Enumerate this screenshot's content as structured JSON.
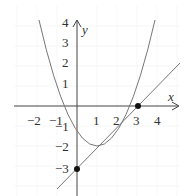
{
  "diagram": {
    "x_axis_label": "x",
    "y_axis_label": "y",
    "x_ticks": [
      "−2",
      "−1",
      "1",
      "2",
      "3",
      "4"
    ],
    "y_ticks": [
      "4",
      "3",
      "2",
      "1",
      "−1",
      "−2",
      "−3"
    ],
    "curves": [
      {
        "name": "parabola",
        "equation": "y = x^2 - 2x - 3"
      },
      {
        "name": "line",
        "equation": "y = x - 3"
      }
    ],
    "points": [
      {
        "label": "(0, -3)",
        "x": 0,
        "y": -3
      },
      {
        "label": "(3, 0)",
        "x": 3,
        "y": 0
      }
    ],
    "colors": {
      "axis": "#444444",
      "curve": "#777777",
      "point": "#111111",
      "grid": "#eeeeee"
    }
  }
}
